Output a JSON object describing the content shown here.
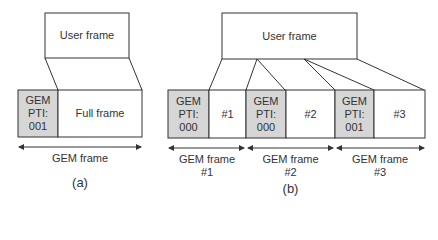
{
  "colors": {
    "stroke": "#333333",
    "header_fill": "#d6d6d6",
    "background": "#ffffff"
  },
  "panel_a": {
    "user_frame_label": "User frame",
    "header_lines": [
      "GEM",
      "PTI:",
      "001"
    ],
    "payload_label": "Full frame",
    "span_label": "GEM frame",
    "caption": "(a)"
  },
  "panel_b": {
    "user_frame_label": "User frame",
    "segments": [
      {
        "header_lines": [
          "GEM",
          "PTI:",
          "000"
        ],
        "payload_label": "#1",
        "span_label": "GEM frame",
        "span_number": "#1"
      },
      {
        "header_lines": [
          "GEM",
          "PTI:",
          "000"
        ],
        "payload_label": "#2",
        "span_label": "GEM frame",
        "span_number": "#2"
      },
      {
        "header_lines": [
          "GEM",
          "PTI:",
          "001"
        ],
        "payload_label": "#3",
        "span_label": "GEM frame",
        "span_number": "#3"
      }
    ],
    "caption": "(b)"
  }
}
